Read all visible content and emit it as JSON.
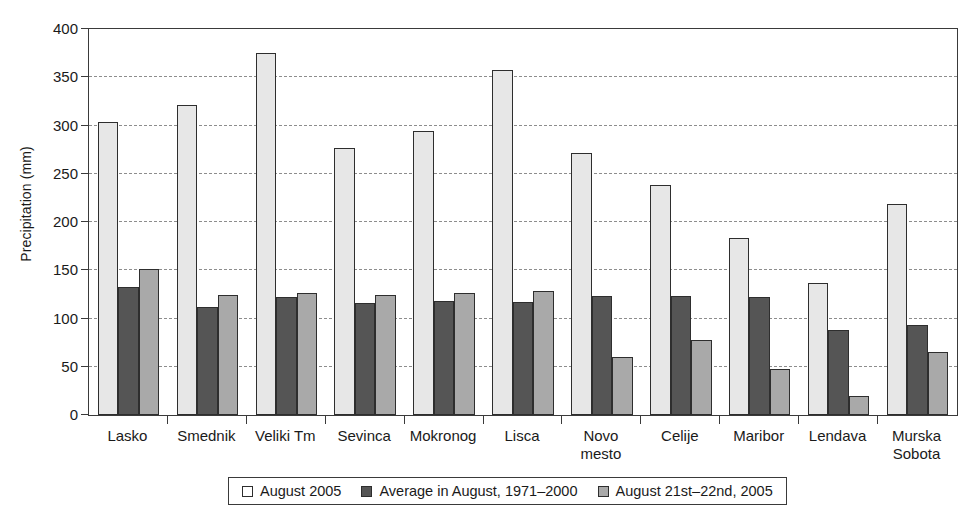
{
  "chart_data": {
    "type": "bar",
    "title": "",
    "xlabel": "",
    "ylabel": "Precipitation (mm)",
    "ylim": [
      0,
      400
    ],
    "ytick_step": 50,
    "yticks": [
      0,
      50,
      100,
      150,
      200,
      250,
      300,
      350,
      400
    ],
    "grid": true,
    "legend_position": "bottom",
    "categories": [
      "Lasko",
      "Smednik",
      "Veliki Tm",
      "Sevinca",
      "Mokronog",
      "Lisca",
      "Novo\nmesto",
      "Celije",
      "Maribor",
      "Lendava",
      "Murska\nSobota"
    ],
    "series": [
      {
        "name": "August 2005",
        "color": "#e7e7e7",
        "values": [
          304,
          321,
          375,
          277,
          294,
          358,
          272,
          238,
          183,
          137,
          219
        ]
      },
      {
        "name": "Average in August, 1971–2000",
        "color": "#555555",
        "values": [
          133,
          112,
          122,
          116,
          118,
          117,
          123,
          123,
          122,
          88,
          93
        ]
      },
      {
        "name": "August 21st–22nd, 2005",
        "color": "#a9a9a9",
        "values": [
          151,
          124,
          126,
          124,
          126,
          128,
          60,
          78,
          48,
          20,
          65
        ]
      }
    ]
  },
  "legend": {
    "items": [
      {
        "label": "August 2005",
        "swatch": "series-0-swatch"
      },
      {
        "label": "Average in August, 1971–2000",
        "swatch": "series-1-swatch"
      },
      {
        "label": "August 21st–22nd, 2005",
        "swatch": "series-2-swatch"
      }
    ]
  },
  "colors": {
    "axis": "#3a3a3a",
    "grid": "#8d8d8d",
    "series_0": "#e7e7e7",
    "series_1": "#555555",
    "series_2": "#a9a9a9",
    "text": "#1a1a1a",
    "background": "#ffffff"
  }
}
